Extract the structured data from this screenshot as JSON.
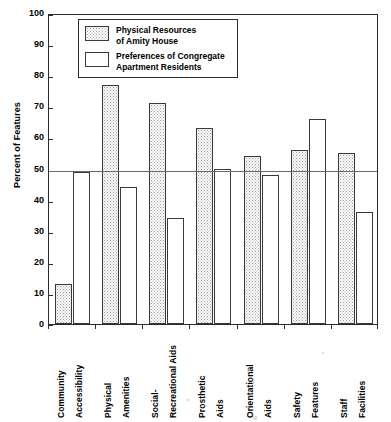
{
  "chart_data": {
    "type": "bar",
    "title": "",
    "subtitle": "",
    "xlabel": "",
    "ylabel": "Percent of Features",
    "ylim": [
      0,
      100
    ],
    "ytick_labels": [
      "100",
      "90",
      "80",
      "70",
      "60",
      "50",
      "40",
      "30",
      "20",
      "10",
      "0"
    ],
    "ytick_values": [
      100,
      90,
      80,
      70,
      60,
      50,
      40,
      30,
      20,
      10,
      0
    ],
    "grid": false,
    "legend_position": "top-left-inside",
    "categories": [
      "Community Accessibility",
      "Physical Amenities",
      "Social-Recreational Aids",
      "Prosthetic Aids",
      "Orientational Aids",
      "Safety Features",
      "Staff Facilities"
    ],
    "category_lines": [
      [
        "Community",
        "Accessibility"
      ],
      [
        "Physical",
        "Amenities"
      ],
      [
        "Social-",
        "Recreational Aids"
      ],
      [
        "Prosthetic",
        "Aids"
      ],
      [
        "Orientational",
        "Aids"
      ],
      [
        "Safety",
        "Features"
      ],
      [
        "Staff",
        "Facilities"
      ]
    ],
    "series": [
      {
        "name": "Physical Resources of Amity House",
        "name_lines": [
          "Physical Resources",
          "of Amity House"
        ],
        "fill": "stippled-gray",
        "values": [
          13,
          77,
          71,
          63,
          54,
          56,
          55
        ]
      },
      {
        "name": "Preferences of Congregate Apartment Residents",
        "name_lines": [
          "Preferences of Congregate",
          "Apartment Residents"
        ],
        "fill": "white",
        "values": [
          49,
          44,
          34,
          50,
          48,
          66,
          36
        ]
      }
    ],
    "annotations": [
      {
        "type": "hline",
        "value": 50,
        "label": "50 percent reference line",
        "color": "#6a6a6a"
      }
    ]
  },
  "colors": {
    "axis": "#2b2b2b",
    "bar_outline": "#3a3a3a",
    "stipple": "#9a9a9a",
    "reference_line": "#6a6a6a",
    "background": "#ffffff"
  }
}
